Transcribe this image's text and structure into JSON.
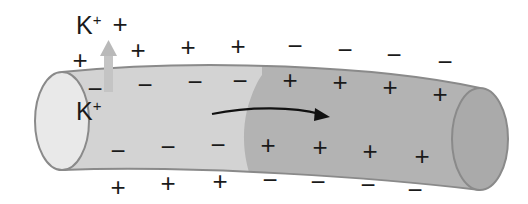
{
  "diagram": {
    "colors": {
      "resting_segment": "#d3d3d3",
      "depolarized_segment": "#b3b3b3",
      "left_cap": "#e9e9e9",
      "right_cap": "#aaaaaa",
      "outline": "#8a8a8a",
      "k_arrow": "#c4c4c4",
      "propagation_arrow": "#111111"
    },
    "labels": {
      "k_outside": {
        "base": "K",
        "sup": "+"
      },
      "k_inside": {
        "base": "K",
        "sup": "+"
      }
    },
    "charges": {
      "outside_top": [
        {
          "sign": "+",
          "x": 120,
          "y": 24
        },
        {
          "sign": "+",
          "x": 80,
          "y": 60
        },
        {
          "sign": "+",
          "x": 138,
          "y": 50
        },
        {
          "sign": "+",
          "x": 188,
          "y": 47
        },
        {
          "sign": "+",
          "x": 238,
          "y": 46
        },
        {
          "sign": "−",
          "x": 295,
          "y": 46
        },
        {
          "sign": "−",
          "x": 345,
          "y": 50
        },
        {
          "sign": "−",
          "x": 394,
          "y": 55
        },
        {
          "sign": "−",
          "x": 445,
          "y": 62
        }
      ],
      "inside_top": [
        {
          "sign": "−",
          "x": 95,
          "y": 89
        },
        {
          "sign": "−",
          "x": 145,
          "y": 85
        },
        {
          "sign": "−",
          "x": 195,
          "y": 82
        },
        {
          "sign": "−",
          "x": 240,
          "y": 81
        },
        {
          "sign": "+",
          "x": 290,
          "y": 80
        },
        {
          "sign": "+",
          "x": 340,
          "y": 82
        },
        {
          "sign": "+",
          "x": 390,
          "y": 87
        },
        {
          "sign": "+",
          "x": 440,
          "y": 94
        }
      ],
      "inside_bottom": [
        {
          "sign": "−",
          "x": 118,
          "y": 151
        },
        {
          "sign": "−",
          "x": 168,
          "y": 147
        },
        {
          "sign": "−",
          "x": 218,
          "y": 145
        },
        {
          "sign": "+",
          "x": 268,
          "y": 145
        },
        {
          "sign": "+",
          "x": 320,
          "y": 147
        },
        {
          "sign": "+",
          "x": 370,
          "y": 151
        },
        {
          "sign": "+",
          "x": 422,
          "y": 156
        }
      ],
      "outside_bottom": [
        {
          "sign": "+",
          "x": 118,
          "y": 187
        },
        {
          "sign": "+",
          "x": 168,
          "y": 183
        },
        {
          "sign": "+",
          "x": 220,
          "y": 181
        },
        {
          "sign": "−",
          "x": 270,
          "y": 180
        },
        {
          "sign": "−",
          "x": 318,
          "y": 182
        },
        {
          "sign": "−",
          "x": 368,
          "y": 185
        },
        {
          "sign": "−",
          "x": 415,
          "y": 190
        }
      ]
    }
  }
}
